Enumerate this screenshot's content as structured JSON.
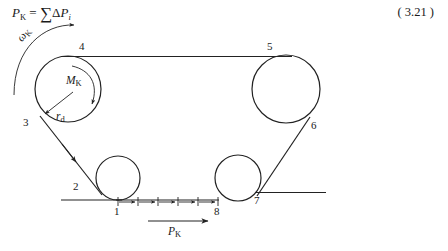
{
  "equation": {
    "lhs_symbol": "P",
    "lhs_sub": "K",
    "equals": "=",
    "sum_symbol": "∑",
    "delta": "Δ",
    "rhs_symbol": "P",
    "rhs_sub": "i",
    "number": "( 3.21 )"
  },
  "diagram": {
    "labels": {
      "omega": "ω",
      "omega_sub": "K",
      "moment": "M",
      "moment_sub": "K",
      "radius": "r",
      "radius_sub": "d",
      "force": "P",
      "force_sub": "K"
    },
    "nodes": [
      {
        "id": "1",
        "x": 116,
        "y": 211
      },
      {
        "id": "2",
        "x": 76,
        "y": 186
      },
      {
        "id": "3",
        "x": 25,
        "y": 122
      },
      {
        "id": "4",
        "x": 80,
        "y": 42
      },
      {
        "id": "5",
        "x": 268,
        "y": 42
      },
      {
        "id": "6",
        "x": 311,
        "y": 122
      },
      {
        "id": "7",
        "x": 255,
        "y": 198
      },
      {
        "id": "8",
        "x": 216,
        "y": 211
      }
    ],
    "pulleys": [
      {
        "name": "driver-pulley",
        "cx": 68,
        "cy": 89,
        "r": 33
      },
      {
        "name": "top-right-pulley",
        "cx": 286,
        "cy": 89,
        "r": 34
      },
      {
        "name": "lower-left-idler",
        "cx": 118,
        "cy": 178,
        "r": 22
      },
      {
        "name": "lower-right-idler",
        "cx": 238,
        "cy": 178,
        "r": 23
      }
    ],
    "colors": {
      "stroke": "#222222",
      "text": "#1a1a1a",
      "background": "#ffffff"
    }
  }
}
